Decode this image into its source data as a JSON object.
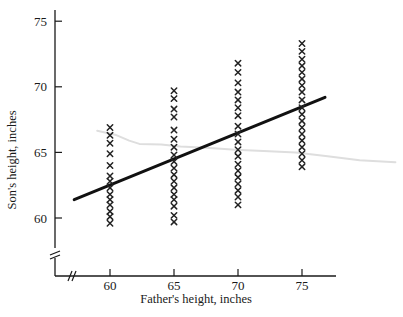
{
  "chart_data": {
    "type": "scatter",
    "title": "",
    "xlabel": "Father's height, inches",
    "ylabel": "Son's height, inches",
    "xlim": [
      57.2,
      82.5
    ],
    "ylim": [
      58.2,
      75.9
    ],
    "xticks": [
      60,
      65,
      70,
      75
    ],
    "xtick_labels": [
      "60",
      "65",
      "70",
      "75"
    ],
    "yticks": [
      60,
      65,
      70,
      75
    ],
    "ytick_labels": [
      "60",
      "65",
      "70",
      "75"
    ],
    "grid": false,
    "legend": null,
    "axis_break_x": true,
    "axis_break_y": true,
    "marker": "x",
    "marker_color": "#222222",
    "series": [
      {
        "name": "Father 60 in",
        "x": 60,
        "values": [
          66.9,
          66.3,
          65.7,
          64.9,
          64.0,
          63.2,
          62.8,
          62.3,
          61.8,
          61.4,
          61.0,
          60.5,
          60.1,
          59.6
        ]
      },
      {
        "name": "Father 65 in",
        "x": 65,
        "values": [
          69.7,
          69.1,
          68.3,
          67.7,
          66.7,
          66.0,
          65.4,
          64.8,
          64.3,
          63.8,
          63.3,
          62.8,
          62.3,
          61.8,
          61.4,
          60.9,
          60.2,
          59.7
        ]
      },
      {
        "name": "Father 70 in",
        "x": 70,
        "values": [
          71.8,
          71.1,
          70.3,
          69.6,
          69.0,
          68.4,
          67.8,
          67.0,
          66.4,
          65.8,
          65.2,
          64.7,
          64.1,
          63.6,
          63.1,
          62.6,
          62.1,
          61.6,
          61.0
        ]
      },
      {
        "name": "Father 75 in",
        "x": 75,
        "values": [
          73.3,
          72.7,
          72.1,
          71.6,
          71.1,
          70.6,
          70.1,
          69.6,
          69.0,
          68.4,
          67.9,
          67.4,
          66.9,
          66.4,
          65.9,
          65.4,
          64.9,
          64.4,
          63.9
        ]
      }
    ],
    "regression_line": {
      "name": "regression-line",
      "color": "#111111",
      "width_px": 3,
      "x_start": 57.2,
      "y_start": 61.4,
      "x_end": 76.8,
      "y_end": 69.2
    },
    "reference_curve": {
      "name": "sma-curve",
      "color": "#dedede",
      "width_px": 2,
      "points": [
        [
          59.0,
          66.65
        ],
        [
          60.4,
          66.35
        ],
        [
          61.5,
          65.9
        ],
        [
          62.3,
          65.65
        ],
        [
          64.0,
          65.6
        ],
        [
          65.5,
          65.45
        ],
        [
          67.5,
          65.35
        ],
        [
          69.8,
          65.2
        ],
        [
          72.0,
          65.1
        ],
        [
          74.5,
          65.0
        ],
        [
          77.0,
          64.7
        ],
        [
          79.5,
          64.4
        ],
        [
          82.3,
          64.25
        ]
      ]
    }
  }
}
